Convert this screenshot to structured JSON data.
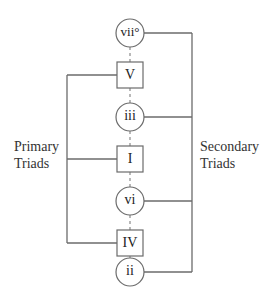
{
  "diagram": {
    "nodes": [
      {
        "id": "vii_dim",
        "label": "vii°",
        "shape": "circle",
        "group": "secondary"
      },
      {
        "id": "V",
        "label": "V",
        "shape": "square",
        "group": "primary"
      },
      {
        "id": "iii",
        "label": "iii",
        "shape": "circle",
        "group": "secondary"
      },
      {
        "id": "I",
        "label": "I",
        "shape": "square",
        "group": "primary"
      },
      {
        "id": "vi",
        "label": "vi",
        "shape": "circle",
        "group": "secondary"
      },
      {
        "id": "IV",
        "label": "IV",
        "shape": "square",
        "group": "primary"
      },
      {
        "id": "ii",
        "label": "ii",
        "shape": "circle",
        "group": "secondary"
      }
    ],
    "groups": {
      "primary": {
        "line1": "Primary",
        "line2": "Triads"
      },
      "secondary": {
        "line1": "Secondary",
        "line2": "Triads"
      }
    },
    "colors": {
      "stroke": "#6b6b6b",
      "text": "#222222",
      "background": "#ffffff"
    }
  }
}
